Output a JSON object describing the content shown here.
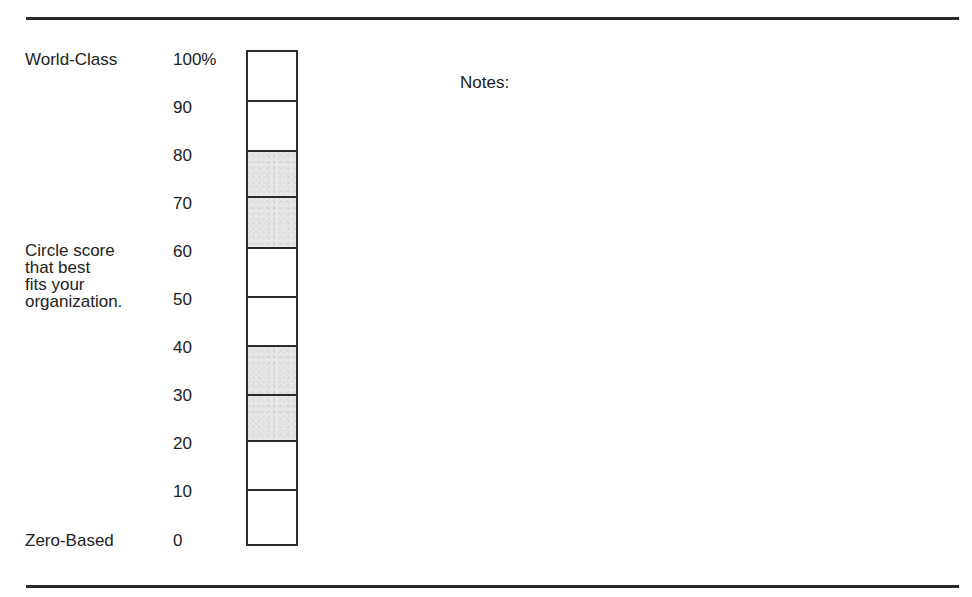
{
  "labels": {
    "top": "World-Class",
    "middle_lines": [
      "Circle score",
      "that best",
      "fits your",
      "organization."
    ],
    "bottom": "Zero-Based",
    "notes": "Notes:"
  },
  "scale": {
    "ticks": [
      {
        "label": "100%",
        "top": 51
      },
      {
        "label": "90",
        "top": 99
      },
      {
        "label": "80",
        "top": 147
      },
      {
        "label": "70",
        "top": 195
      },
      {
        "label": "60",
        "top": 243
      },
      {
        "label": "50",
        "top": 291
      },
      {
        "label": "40",
        "top": 339
      },
      {
        "label": "30",
        "top": 387
      },
      {
        "label": "20",
        "top": 435
      },
      {
        "label": "10",
        "top": 483
      },
      {
        "label": "0",
        "top": 532
      }
    ],
    "cells": [
      {
        "range": "90-100",
        "shaded": false
      },
      {
        "range": "80-90",
        "shaded": false
      },
      {
        "range": "70-80",
        "shaded": true
      },
      {
        "range": "60-70",
        "shaded": true
      },
      {
        "range": "50-60",
        "shaded": false
      },
      {
        "range": "40-50",
        "shaded": false
      },
      {
        "range": "30-40",
        "shaded": true
      },
      {
        "range": "20-30",
        "shaded": true
      },
      {
        "range": "10-20",
        "shaded": false
      },
      {
        "range": "0-10",
        "shaded": false
      }
    ]
  },
  "colors": {
    "rule": "#2a2a2a",
    "shade": "#e8e8e8",
    "text": "#222222"
  }
}
